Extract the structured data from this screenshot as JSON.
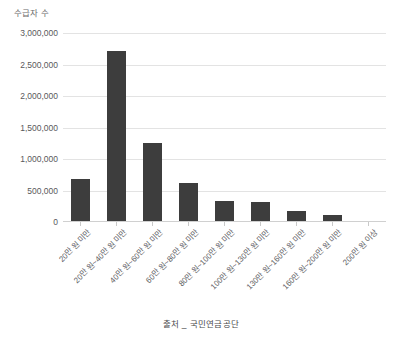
{
  "chart_data": {
    "type": "bar",
    "title": "",
    "ylabel": "수급자 수",
    "xlabel": "",
    "source_note": "출처 _ 국민연금공단",
    "categories": [
      "20만 원 미만",
      "20만 원~40만 원 미만",
      "40만 원~60만 원 미만",
      "60만 원~80만 원 미만",
      "80만 원~100만 원 미만",
      "100만 원~130만 원 미만",
      "130만 원~160만 원 미만",
      "160만 원~200만 원 미만",
      "200만 원 이상"
    ],
    "values": [
      680000,
      2720000,
      1260000,
      620000,
      340000,
      325000,
      175000,
      110000,
      20000
    ],
    "ylim": [
      0,
      3000000
    ],
    "ytick_values": [
      0,
      500000,
      1000000,
      1500000,
      2000000,
      2500000,
      3000000
    ],
    "ytick_labels": [
      "0",
      "500,000",
      "1,000,000",
      "1,500,000",
      "2,000,000",
      "2,500,000",
      "3,000,000"
    ],
    "grid": true,
    "legend": "none",
    "bar_color": "#3d3d3d",
    "gridline_color": "#e3e3e3",
    "background_color": "#ffffff"
  }
}
